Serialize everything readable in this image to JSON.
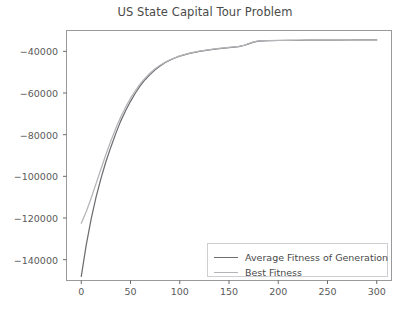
{
  "figure": {
    "title": "US State Capital Tour Problem",
    "top_edge_clipped_text": "",
    "bottom_caption_clipped_text": ""
  },
  "legend": {
    "position": "lower right",
    "entries": [
      {
        "label": "Average Fitness of Generation",
        "color": "#6e6e72"
      },
      {
        "label": "Best Fitness",
        "color": "#b4b4b8"
      }
    ]
  },
  "axes": {
    "x_tick_labels": [
      "0",
      "50",
      "100",
      "150",
      "200",
      "250",
      "300"
    ],
    "y_tick_labels": [
      "−40000",
      "−60000",
      "−80000",
      "−100000",
      "−120000",
      "−140000"
    ],
    "frame_color": "#9a9a9e",
    "tick_color": "#5a5a5a"
  },
  "chart_data": {
    "type": "line",
    "title": "US State Capital Tour Problem",
    "xlabel": "",
    "ylabel": "",
    "xlim": [
      -15,
      315
    ],
    "ylim": [
      -150000,
      -30000
    ],
    "xticks": [
      0,
      50,
      100,
      150,
      200,
      250,
      300
    ],
    "yticks": [
      -40000,
      -60000,
      -80000,
      -100000,
      -120000,
      -140000
    ],
    "grid": false,
    "legend_position": "lower right",
    "series": [
      {
        "name": "Average Fitness of Generation",
        "color": "#6e6e72",
        "x": [
          0,
          5,
          10,
          15,
          20,
          25,
          30,
          35,
          40,
          45,
          50,
          55,
          60,
          65,
          70,
          75,
          80,
          85,
          90,
          95,
          100,
          110,
          120,
          130,
          140,
          150,
          160,
          165,
          170,
          175,
          180,
          190,
          200,
          210,
          220,
          230,
          240,
          250,
          260,
          270,
          280,
          290,
          300
        ],
        "y": [
          -148000,
          -133000,
          -120500,
          -110000,
          -101000,
          -93000,
          -86000,
          -79500,
          -73500,
          -68500,
          -64000,
          -60000,
          -56500,
          -53500,
          -51000,
          -48800,
          -47000,
          -45500,
          -44200,
          -43200,
          -42300,
          -41000,
          -40000,
          -39300,
          -38700,
          -38200,
          -37700,
          -37200,
          -36400,
          -35600,
          -35100,
          -34900,
          -34800,
          -34750,
          -34700,
          -34650,
          -34620,
          -34600,
          -34580,
          -34560,
          -34545,
          -34535,
          -34520
        ]
      },
      {
        "name": "Best Fitness",
        "color": "#b4b4b8",
        "x": [
          0,
          5,
          10,
          15,
          20,
          25,
          30,
          35,
          40,
          45,
          50,
          55,
          60,
          65,
          70,
          75,
          80,
          85,
          90,
          95,
          100,
          110,
          120,
          130,
          140,
          150,
          160,
          165,
          170,
          175,
          180,
          190,
          200,
          210,
          220,
          230,
          240,
          250,
          260,
          270,
          280,
          290,
          300
        ],
        "y": [
          -122500,
          -117000,
          -110500,
          -103500,
          -96500,
          -89500,
          -83000,
          -77000,
          -71500,
          -66800,
          -62500,
          -58800,
          -55500,
          -52800,
          -50400,
          -48400,
          -46700,
          -45300,
          -44100,
          -43100,
          -42200,
          -40900,
          -39900,
          -39200,
          -38600,
          -38100,
          -37600,
          -37100,
          -36300,
          -35500,
          -35000,
          -34850,
          -34760,
          -34720,
          -34680,
          -34640,
          -34610,
          -34590,
          -34575,
          -34555,
          -34540,
          -34530,
          -34515
        ]
      }
    ]
  }
}
